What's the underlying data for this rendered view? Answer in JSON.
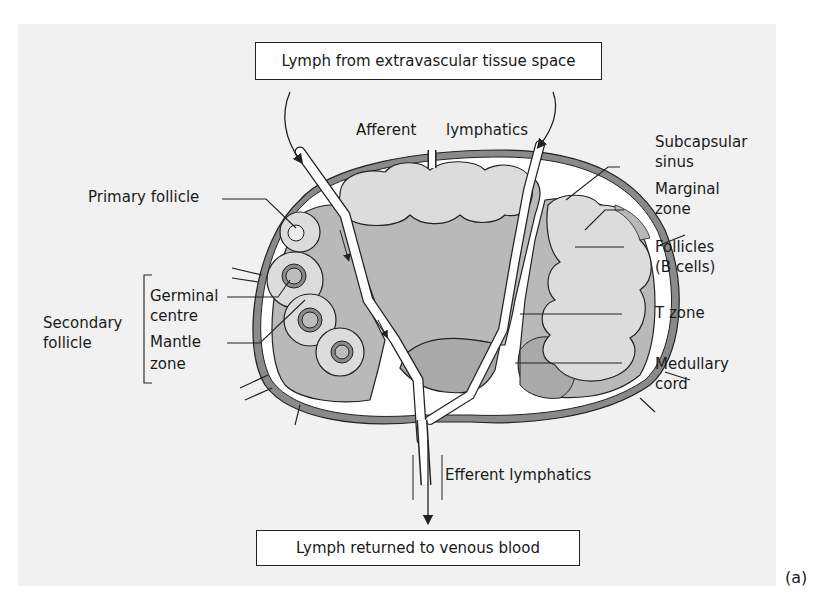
{
  "figure": {
    "title_box_top": "Lymph from extravascular tissue space",
    "title_box_bottom": "Lymph returned to venous blood",
    "panel_tag": "(a)"
  },
  "labels": {
    "afferent": "Afferent",
    "lymphatics": "lymphatics",
    "efferent_lymphatics": "Efferent lymphatics",
    "primary_follicle": "Primary follicle",
    "secondary_follicle_line1": "Secondary",
    "secondary_follicle_line2": "follicle",
    "germinal_line1": "Germinal",
    "germinal_line2": "centre",
    "mantle_line1": "Mantle",
    "mantle_line2": "zone",
    "subcapsular_line1": "Subcapsular",
    "subcapsular_line2": "sinus",
    "marginal_line1": "Marginal",
    "marginal_line2": "zone",
    "follicles_line1": "Follicles",
    "follicles_line2": "(B cells)",
    "t_zone": "T zone",
    "medullary_line1": "Medullary",
    "medullary_line2": "cord"
  },
  "colors": {
    "panel_bg": "#f1f1f1",
    "capsule": "#8a8a8a",
    "sinus": "#ffffff",
    "t_zone_fill": "#b9b9b9",
    "follicle_fill": "#dcdcdc",
    "medulla_fill": "#a9a9a9",
    "outline": "#222222"
  }
}
